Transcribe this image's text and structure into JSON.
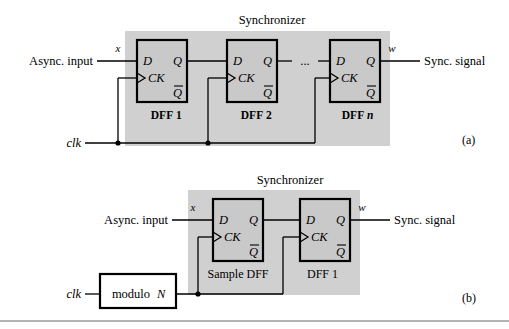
{
  "figure": {
    "domain_note": "Digital logic block diagram of synchronizer circuits",
    "panels": [
      {
        "id": "a",
        "caption": "(a)",
        "synchronizer_label": "Synchronizer",
        "input_label": "Async. input",
        "input_signal": "x",
        "output_label": "Sync. signal",
        "output_signal": "w",
        "clock_label": "clk",
        "flipflops": [
          {
            "name_prefix": "DFF",
            "name_suffix": "1",
            "suffix_italic": false,
            "pin_d": "D",
            "pin_q": "Q",
            "pin_ck": "CK",
            "pin_qbar": "Q"
          },
          {
            "name_prefix": "DFF",
            "name_suffix": "2",
            "suffix_italic": false,
            "pin_d": "D",
            "pin_q": "Q",
            "pin_ck": "CK",
            "pin_qbar": "Q"
          },
          {
            "name_prefix": "DFF",
            "name_suffix": "n",
            "suffix_italic": true,
            "pin_d": "D",
            "pin_q": "Q",
            "pin_ck": "CK",
            "pin_qbar": "Q"
          }
        ],
        "ellipsis": "..."
      },
      {
        "id": "b",
        "caption": "(b)",
        "synchronizer_label": "Synchronizer",
        "input_label": "Async. input",
        "input_signal": "x",
        "output_label": "Sync. signal",
        "output_signal": "w",
        "clock_label": "clk",
        "divider_label_prefix": "modulo",
        "divider_label_suffix": "N",
        "flipflops": [
          {
            "name_prefix": "Sample DFF",
            "name_suffix": "",
            "suffix_italic": false,
            "pin_d": "D",
            "pin_q": "Q",
            "pin_ck": "CK",
            "pin_qbar": "Q"
          },
          {
            "name_prefix": "DFF",
            "name_suffix": "1",
            "suffix_italic": false,
            "pin_d": "D",
            "pin_q": "Q",
            "pin_ck": "CK",
            "pin_qbar": "Q"
          }
        ]
      }
    ],
    "colors": {
      "shade": "#d0d0d0",
      "block_fill": "#c9c9c9",
      "line": "#000000",
      "background": "#ffffff",
      "rule": "#9a9a9a"
    }
  }
}
